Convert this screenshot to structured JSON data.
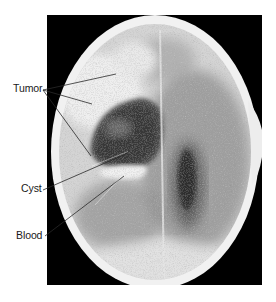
{
  "figure": {
    "type": "annotated-ct-scan",
    "frame": {
      "x": 47,
      "y": 15,
      "width": 215,
      "height": 270,
      "background": "#000000"
    },
    "skull": {
      "center": [
        155,
        152
      ],
      "rx": 104,
      "ry": 136,
      "bone_color": "#f2f2f2",
      "brain_color": "#d9d9d9"
    },
    "labels": [
      {
        "id": "tumor",
        "text": "Tumor",
        "anchor": [
          43,
          90
        ],
        "pointers": [
          [
            116,
            74
          ],
          [
            92,
            104
          ],
          [
            91,
            156
          ]
        ]
      },
      {
        "id": "cyst",
        "text": "Cyst",
        "anchor": [
          43,
          190
        ],
        "pointers": [
          [
            128,
            153
          ]
        ]
      },
      {
        "id": "blood",
        "text": "Blood",
        "anchor": [
          45,
          236
        ],
        "pointers": [
          [
            124,
            176
          ]
        ]
      }
    ],
    "colors": {
      "leader_line": "#2a2a2a",
      "label_text": "#1a1a1a",
      "background": "#ffffff"
    }
  }
}
